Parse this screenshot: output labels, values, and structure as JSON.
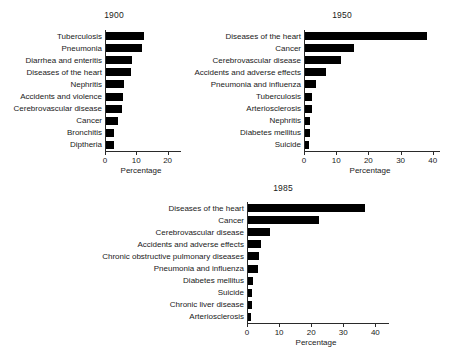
{
  "figure": {
    "caption_absent": true
  },
  "chart_data": [
    {
      "type": "bar",
      "orientation": "horizontal",
      "title": "1900",
      "xlabel": "Percentage",
      "ylabel": "",
      "xlim": [
        0,
        23
      ],
      "xticks": [
        0,
        10,
        20
      ],
      "xticklabels": [
        "0",
        "10",
        "20"
      ],
      "grid": false,
      "legend": null,
      "categories": [
        "Tuberculosis",
        "Pneumonia",
        "Diarrhea and enteritis",
        "Diseases of the heart",
        "Nephritis",
        "Accidents and violence",
        "Cerebrovascular disease",
        "Cancer",
        "Bronchitis",
        "Diptheria"
      ],
      "values": [
        12.2,
        11.5,
        8.2,
        8.0,
        5.8,
        5.5,
        5.0,
        3.7,
        2.7,
        2.5
      ]
    },
    {
      "type": "bar",
      "orientation": "horizontal",
      "title": "1950",
      "xlabel": "Percentage",
      "ylabel": "",
      "xlim": [
        0,
        41
      ],
      "xticks": [
        0,
        10,
        20,
        30,
        40
      ],
      "xticklabels": [
        "0",
        "10",
        "20",
        "30",
        "40"
      ],
      "grid": false,
      "legend": null,
      "categories": [
        "Diseases of the heart",
        "Cancer",
        "Cerebrovascular disease",
        "Accidents and adverse effects",
        "Pneumonia and influenza",
        "Tuberculosis",
        "Arteriosclerosis",
        "Nephritis",
        "Diabetes mellitus",
        "Suicide"
      ],
      "values": [
        37.8,
        15.2,
        11.3,
        6.5,
        3.3,
        2.3,
        2.1,
        1.6,
        1.5,
        1.1
      ]
    },
    {
      "type": "bar",
      "orientation": "horizontal",
      "title": "1985",
      "xlabel": "Percentage",
      "ylabel": "",
      "xlim": [
        0,
        43
      ],
      "xticks": [
        0,
        10,
        20,
        30,
        40
      ],
      "xticklabels": [
        "0",
        "10",
        "20",
        "30",
        "40"
      ],
      "grid": false,
      "legend": null,
      "categories": [
        "Diseases of the heart",
        "Cancer",
        "Cerebrovascular disease",
        "Accidents and adverse effects",
        "Chronic obstructive pulmonary diseases",
        "Pneumonia and influenza",
        "Diabetes mellitus",
        "Suicide",
        "Chronic liver disease",
        "Arteriosclerosis"
      ],
      "values": [
        36.4,
        22.1,
        6.8,
        4.0,
        3.3,
        3.0,
        1.6,
        1.3,
        1.1,
        0.8
      ]
    }
  ],
  "style": {
    "bar_color": "#000000",
    "axis_color": "#2a2a2a",
    "text_color": "#1a1a1a",
    "background": "#ffffff"
  }
}
